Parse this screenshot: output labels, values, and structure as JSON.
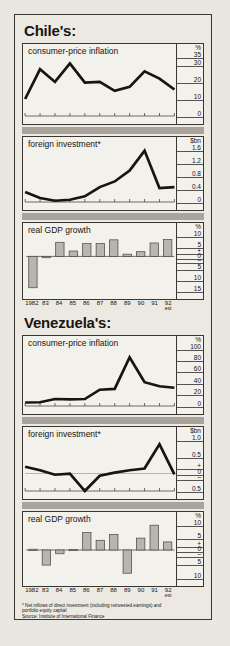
{
  "figure": {
    "sections": [
      {
        "id": "chile",
        "title": "Chile's:",
        "panels": [
          {
            "id": "chile-cpi",
            "title": "consumer-price inflation",
            "axis_labels": [
              "35",
              "%",
              "30",
              "20",
              "10",
              "0"
            ]
          },
          {
            "id": "chile-fdi",
            "title": "foreign investment*",
            "axis_labels": [
              "1.6",
              "$bn",
              "1.2",
              "0.8",
              "0.4",
              "0"
            ]
          },
          {
            "id": "chile-gdp",
            "title": "real GDP growth",
            "axis_labels": [
              "10",
              "%",
              "5",
              "+",
              "0",
              "–",
              "5",
              "10",
              "15"
            ]
          }
        ]
      },
      {
        "id": "venezuela",
        "title": "Venezuela's:",
        "panels": [
          {
            "id": "ven-cpi",
            "title": "consumer-price inflation",
            "axis_labels": [
              "100",
              "%",
              "80",
              "60",
              "40",
              "20",
              "0"
            ]
          },
          {
            "id": "ven-fdi",
            "title": "foreign investment*",
            "axis_labels": [
              "1.0",
              "$bn",
              "0.5",
              "+",
              "0",
              "–",
              "0.5"
            ]
          },
          {
            "id": "ven-gdp",
            "title": "real GDP growth",
            "axis_labels": [
              "10",
              "%",
              "5",
              "+",
              "0",
              "–",
              "5",
              "10"
            ]
          }
        ]
      }
    ],
    "year_labels": [
      "1982",
      "83",
      "84",
      "85",
      "86",
      "87",
      "88",
      "89",
      "90",
      "91",
      "92"
    ],
    "year_last_note": "est",
    "footnote_line1": "* Net inflows of direct investment (including reinvested earnings) and",
    "footnote_line2": "portfolio equity capital",
    "footnote_line3": "Source: Institute of International Finance",
    "colors": {
      "ink": "#3a3733",
      "paper": "#f3f1ec",
      "mat": "#ece9e3",
      "band": "#a8a49c",
      "bar_fill": "#b9b5ad"
    }
  },
  "chart_data": [
    {
      "type": "line",
      "id": "chile-cpi",
      "title": "consumer-price inflation",
      "country": "Chile",
      "ylabel": "%",
      "ylim": [
        0,
        35
      ],
      "yticks": [
        0,
        10,
        20,
        30,
        35
      ],
      "grid": false,
      "x": [
        "1982",
        "83",
        "84",
        "85",
        "86",
        "87",
        "88",
        "89",
        "90",
        "91",
        "92"
      ],
      "values": [
        9.9,
        27.3,
        19.9,
        30.7,
        19.5,
        19.9,
        14.7,
        17.0,
        26.0,
        21.8,
        15.5
      ]
    },
    {
      "type": "line",
      "id": "chile-fdi",
      "title": "foreign investment*",
      "country": "Chile",
      "ylabel": "$bn",
      "ylim": [
        0,
        1.6
      ],
      "yticks": [
        0,
        0.4,
        0.8,
        1.2,
        1.6
      ],
      "grid": false,
      "x": [
        "1982",
        "83",
        "84",
        "85",
        "86",
        "87",
        "88",
        "89",
        "90",
        "91",
        "92"
      ],
      "values": [
        0.3,
        0.12,
        0.04,
        0.07,
        0.17,
        0.45,
        0.62,
        0.95,
        1.55,
        0.42,
        0.45
      ]
    },
    {
      "type": "bar",
      "id": "chile-gdp",
      "title": "real GDP growth",
      "country": "Chile",
      "ylabel": "%",
      "ylim": [
        -15,
        10
      ],
      "yticks": [
        -15,
        -10,
        -5,
        0,
        5,
        10
      ],
      "grid": false,
      "categories": [
        "1982",
        "83",
        "84",
        "85",
        "86",
        "87",
        "88",
        "89",
        "90",
        "91",
        "92"
      ],
      "values": [
        -14.0,
        -0.6,
        6.3,
        2.4,
        5.7,
        5.7,
        7.4,
        1.0,
        2.1,
        6.0,
        7.5
      ]
    },
    {
      "type": "line",
      "id": "ven-cpi",
      "title": "consumer-price inflation",
      "country": "Venezuela",
      "ylabel": "%",
      "ylim": [
        0,
        100
      ],
      "yticks": [
        0,
        20,
        40,
        60,
        80,
        100
      ],
      "grid": false,
      "x": [
        "1982",
        "83",
        "84",
        "85",
        "86",
        "87",
        "88",
        "89",
        "90",
        "91",
        "92"
      ],
      "values": [
        6.0,
        6.5,
        12.0,
        11.5,
        12.0,
        28.0,
        29.5,
        84.0,
        41.0,
        34.0,
        31.5
      ]
    },
    {
      "type": "line",
      "id": "ven-fdi",
      "title": "foreign investment*",
      "country": "Venezuela",
      "ylabel": "$bn",
      "ylim": [
        -0.5,
        1.0
      ],
      "yticks": [
        -0.5,
        0,
        0.5,
        1.0
      ],
      "grid": false,
      "x": [
        "1982",
        "83",
        "84",
        "85",
        "86",
        "87",
        "88",
        "89",
        "90",
        "91",
        "92"
      ],
      "values": [
        0.2,
        0.1,
        -0.03,
        0.0,
        -0.5,
        -0.06,
        0.03,
        0.1,
        0.15,
        0.85,
        -0.02
      ]
    },
    {
      "type": "bar",
      "id": "ven-gdp",
      "title": "real GDP growth",
      "country": "Venezuela",
      "ylabel": "%",
      "ylim": [
        -10,
        10
      ],
      "yticks": [
        -10,
        -5,
        0,
        5,
        10
      ],
      "grid": false,
      "categories": [
        "1982",
        "83",
        "84",
        "85",
        "86",
        "87",
        "88",
        "89",
        "90",
        "91",
        "92"
      ],
      "values": [
        0.3,
        -5.6,
        -1.4,
        0.2,
        6.5,
        3.6,
        5.8,
        -8.6,
        4.4,
        9.2,
        3.0
      ]
    }
  ]
}
